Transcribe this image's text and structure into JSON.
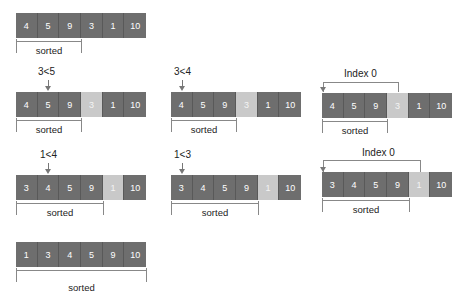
{
  "colors": {
    "cell": "#6e6e6e",
    "highlight": "#c9c9c9",
    "line": "#888888"
  },
  "sorted_label": "sorted",
  "index_label": "Index 0",
  "steps": {
    "s0": {
      "values": [
        "4",
        "5",
        "9",
        "3",
        "1",
        "10"
      ],
      "highlight": -1
    },
    "s1": {
      "compare": "3<5",
      "values": [
        "4",
        "5",
        "9",
        "3",
        "1",
        "10"
      ],
      "highlight": 3
    },
    "s2": {
      "compare": "3<4",
      "values": [
        "4",
        "5",
        "9",
        "3",
        "1",
        "10"
      ],
      "highlight": 3
    },
    "s3": {
      "index": "Index 0",
      "values": [
        "4",
        "5",
        "9",
        "3",
        "1",
        "10"
      ],
      "highlight": 3
    },
    "s4": {
      "compare": "1<4",
      "values": [
        "3",
        "4",
        "5",
        "9",
        "1",
        "10"
      ],
      "highlight": 4
    },
    "s5": {
      "compare": "1<3",
      "values": [
        "3",
        "4",
        "5",
        "9",
        "1",
        "10"
      ],
      "highlight": 4
    },
    "s6": {
      "index": "Index 0",
      "values": [
        "3",
        "4",
        "5",
        "9",
        "1",
        "10"
      ],
      "highlight": 4
    },
    "s7": {
      "values": [
        "1",
        "3",
        "4",
        "5",
        "9",
        "10"
      ],
      "highlight": -1
    }
  }
}
